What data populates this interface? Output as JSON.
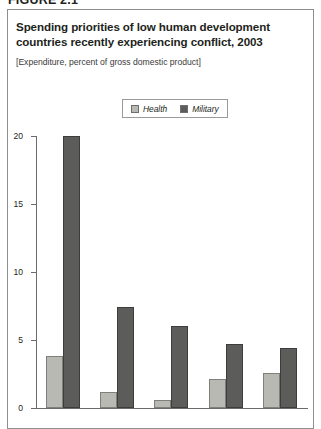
{
  "figure": {
    "label": "FIGURE 2.1"
  },
  "title": "Spending priorities of low human development countries recently experiencing conflict, 2003",
  "subtitle": "[Expenditure, percent of gross domestic product]",
  "legend": {
    "items": [
      {
        "label": "Health",
        "color": "#b9b9b4"
      },
      {
        "label": "Military",
        "color": "#5c5c5a"
      }
    ]
  },
  "axis": {
    "y_ticks": [
      "0",
      "5",
      "10",
      "15",
      "20"
    ]
  },
  "chart_data": {
    "type": "bar",
    "title": "Spending priorities of low human development countries recently experiencing conflict, 2003",
    "subtitle": "[Expenditure, percent of gross domestic product]",
    "xlabel": "",
    "ylabel": "",
    "ylim": [
      0,
      20
    ],
    "yticks": [
      0,
      5,
      10,
      15,
      20
    ],
    "grid": false,
    "legend_position": "top-center",
    "categories": [
      "1",
      "2",
      "3",
      "4",
      "5"
    ],
    "series": [
      {
        "name": "Health",
        "color": "#b9b9b4",
        "values": [
          3.8,
          1.2,
          0.6,
          2.1,
          2.6
        ]
      },
      {
        "name": "Military",
        "color": "#5c5c5a",
        "values": [
          20.0,
          7.4,
          6.0,
          4.7,
          4.4
        ]
      }
    ]
  }
}
